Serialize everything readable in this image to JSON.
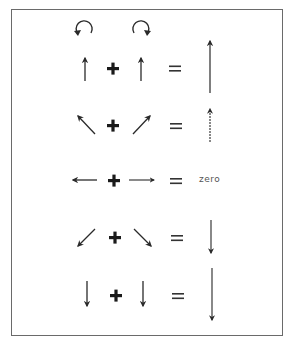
{
  "diagram": {
    "type": "vector-addition",
    "rotation_indicators": [
      {
        "name": "counterclockwise",
        "symbol": "↺"
      },
      {
        "name": "clockwise",
        "symbol": "↻"
      }
    ],
    "operators": {
      "plus": "+",
      "equals": "="
    },
    "rows": [
      {
        "left": "up",
        "right": "up",
        "result": "long up arrow"
      },
      {
        "left": "up-left",
        "right": "up-right",
        "result": "up arrow"
      },
      {
        "left": "left",
        "right": "right",
        "result": "zero"
      },
      {
        "left": "down-left",
        "right": "down-right",
        "result": "down arrow"
      },
      {
        "left": "down",
        "right": "down",
        "result": "long down arrow"
      }
    ],
    "zero_label": "zero",
    "colors": {
      "ink": "#2a2a2a",
      "border": "#6a6a6a",
      "background": "#ffffff"
    }
  }
}
